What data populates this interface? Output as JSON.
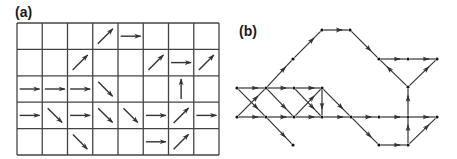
{
  "figure": {
    "panel_a": {
      "label": "(a)",
      "grid": {
        "cols": 8,
        "rows": 5,
        "left": 17,
        "top": 23,
        "right": 219,
        "bottom": 155
      },
      "arrows": [
        {
          "row": 0,
          "col": 3,
          "dir": "NE"
        },
        {
          "row": 0,
          "col": 4,
          "dir": "E"
        },
        {
          "row": 1,
          "col": 2,
          "dir": "NE"
        },
        {
          "row": 1,
          "col": 5,
          "dir": "NE"
        },
        {
          "row": 1,
          "col": 6,
          "dir": "E"
        },
        {
          "row": 1,
          "col": 7,
          "dir": "NE"
        },
        {
          "row": 2,
          "col": 0,
          "dir": "E"
        },
        {
          "row": 2,
          "col": 1,
          "dir": "E"
        },
        {
          "row": 2,
          "col": 2,
          "dir": "E"
        },
        {
          "row": 2,
          "col": 3,
          "dir": "SE"
        },
        {
          "row": 2,
          "col": 6,
          "dir": "N"
        },
        {
          "row": 3,
          "col": 0,
          "dir": "E"
        },
        {
          "row": 3,
          "col": 1,
          "dir": "SE"
        },
        {
          "row": 3,
          "col": 2,
          "dir": "E"
        },
        {
          "row": 3,
          "col": 3,
          "dir": "SE"
        },
        {
          "row": 3,
          "col": 4,
          "dir": "SE"
        },
        {
          "row": 3,
          "col": 5,
          "dir": "E"
        },
        {
          "row": 3,
          "col": 6,
          "dir": "NE"
        },
        {
          "row": 3,
          "col": 7,
          "dir": "E"
        },
        {
          "row": 4,
          "col": 2,
          "dir": "SE"
        },
        {
          "row": 4,
          "col": 5,
          "dir": "E"
        },
        {
          "row": 4,
          "col": 6,
          "dir": "NE"
        }
      ]
    },
    "panel_b": {
      "label": "(b)",
      "nodes": {
        "A1": [
          237,
          88
        ],
        "B1": [
          266,
          88
        ],
        "C1": [
          294,
          88
        ],
        "D1": [
          322,
          88
        ],
        "A2": [
          237,
          117
        ],
        "B2": [
          266,
          117
        ],
        "C2": [
          294,
          117
        ],
        "D2": [
          322,
          117
        ],
        "E2": [
          351,
          117
        ],
        "F2": [
          379,
          117
        ],
        "G2": [
          408,
          117
        ],
        "H2": [
          437,
          117
        ],
        "U1": [
          293,
          59
        ],
        "T1": [
          322,
          30
        ],
        "T2": [
          350,
          30
        ],
        "R1": [
          379,
          59
        ],
        "R2": [
          408,
          59
        ],
        "R3": [
          437,
          59
        ],
        "R4": [
          408,
          87
        ],
        "L1": [
          293,
          145
        ],
        "L2": [
          379,
          145
        ],
        "L3": [
          408,
          145
        ]
      },
      "edges": [
        [
          "A1",
          "B1"
        ],
        [
          "A2",
          "B2"
        ],
        [
          "A1",
          "B2"
        ],
        [
          "A2",
          "B1"
        ],
        [
          "B1",
          "C1"
        ],
        [
          "B1",
          "C2"
        ],
        [
          "B2",
          "C2"
        ],
        [
          "B2",
          "L1"
        ],
        [
          "B1",
          "U1"
        ],
        [
          "U1",
          "T1"
        ],
        [
          "T1",
          "T2"
        ],
        [
          "T2",
          "R1"
        ],
        [
          "C1",
          "D1"
        ],
        [
          "C2",
          "D1"
        ],
        [
          "C1",
          "D2"
        ],
        [
          "C2",
          "D2"
        ],
        [
          "D1",
          "D2"
        ],
        [
          "D1",
          "E2"
        ],
        [
          "D2",
          "E2"
        ],
        [
          "E2",
          "F2"
        ],
        [
          "F2",
          "G2"
        ],
        [
          "G2",
          "H2"
        ],
        [
          "E2",
          "L2"
        ],
        [
          "L2",
          "L3"
        ],
        [
          "L3",
          "G2"
        ],
        [
          "L3",
          "H2"
        ],
        [
          "G2",
          "R4"
        ],
        [
          "R4",
          "R1"
        ],
        [
          "R4",
          "R3"
        ],
        [
          "R1",
          "R2"
        ],
        [
          "R2",
          "R3"
        ]
      ]
    },
    "colors": {
      "line": "#333333",
      "grid": "#444444",
      "background": "#ffffff"
    }
  }
}
